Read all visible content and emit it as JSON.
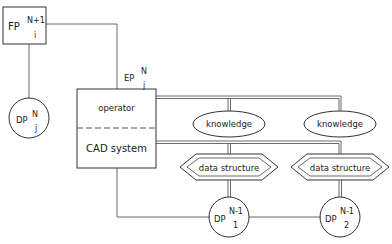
{
  "diagram": {
    "nodes": {
      "fp": {
        "base": "FP",
        "sup": "N+1",
        "sub": "i"
      },
      "dp_j": {
        "base": "DP",
        "sup": "N",
        "sub": "j"
      },
      "ep": {
        "base": "EP",
        "sup": "N",
        "sub": "j"
      },
      "ep_box": {
        "top_label": "operator",
        "bottom_label": "CAD system"
      },
      "knowledge_1": {
        "label": "knowledge"
      },
      "knowledge_2": {
        "label": "knowledge"
      },
      "data_structure_1": {
        "label": "data structure"
      },
      "data_structure_2": {
        "label": "data structure"
      },
      "dp_1": {
        "base": "DP",
        "sup": "N-1",
        "sub": "1"
      },
      "dp_2": {
        "base": "DP",
        "sup": "N-1",
        "sub": "2"
      }
    },
    "edges": [
      [
        "fp",
        "dp_j"
      ],
      [
        "fp",
        "ep_box"
      ],
      [
        "ep_box.operator",
        "knowledge_1"
      ],
      [
        "ep_box.operator",
        "knowledge_2"
      ],
      [
        "ep_box.cad_system",
        "data_structure_1"
      ],
      [
        "ep_box.cad_system",
        "data_structure_2"
      ],
      [
        "data_structure_1",
        "dp_1"
      ],
      [
        "data_structure_2",
        "dp_2"
      ],
      [
        "ep_box",
        "dp_1"
      ],
      [
        "dp_1",
        "dp_2"
      ]
    ]
  }
}
